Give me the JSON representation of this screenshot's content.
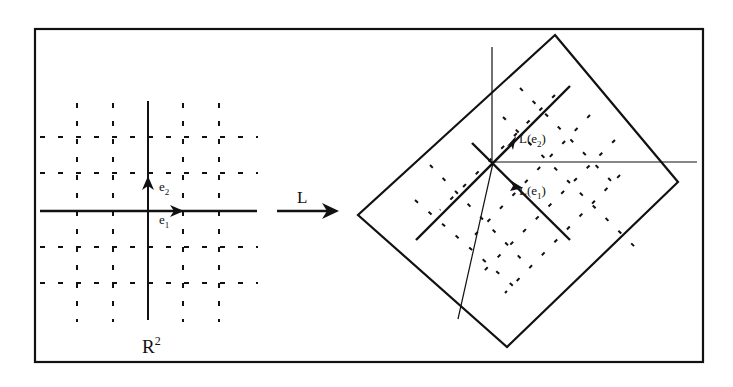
{
  "figure": {
    "left_panel": {
      "space_label": "R",
      "space_superscript": "2",
      "basis": [
        {
          "name": "e1",
          "label_main": "e",
          "label_sub": "1"
        },
        {
          "name": "e2",
          "label_main": "e",
          "label_sub": "2"
        }
      ]
    },
    "map_arrow": {
      "label": "L"
    },
    "right_panel": {
      "images": [
        {
          "name": "L(e2)",
          "label": "L(e",
          "sub": "2",
          "close": ")"
        },
        {
          "name": "L(e1)",
          "label": "L(e",
          "sub": "1",
          "close": ")"
        }
      ]
    },
    "colors": {
      "ink": "#111111",
      "background": "#ffffff"
    }
  }
}
